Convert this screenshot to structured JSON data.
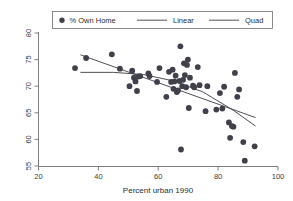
{
  "chart_data": {
    "type": "scatter",
    "title": "",
    "subtitle": "",
    "xlabel": "Percent urban 1990",
    "ylabel": "",
    "xlim": [
      20,
      100
    ],
    "ylim": [
      53,
      81
    ],
    "xticks": [
      20,
      40,
      60,
      80,
      100
    ],
    "yticks": [
      55,
      60,
      65,
      70,
      75,
      80
    ],
    "grid": false,
    "legend_position": "top-center-outside",
    "legend": [
      {
        "label": "% Own Home",
        "type": "marker",
        "marker": "filled-circle",
        "color": "#40404a"
      },
      {
        "label": "Linear",
        "type": "line",
        "color": "#3b3b43"
      },
      {
        "label": "Quad",
        "type": "line",
        "color": "#3b3b43"
      }
    ],
    "series": [
      {
        "name": "% Own Home",
        "type": "scatter",
        "marker": "filled-circle",
        "color": "#40404a",
        "points": [
          [
            32.2,
            73.4
          ],
          [
            35.9,
            75.3
          ],
          [
            44.5,
            76.0
          ],
          [
            47.2,
            73.3
          ],
          [
            50.4,
            70.0
          ],
          [
            51.3,
            72.9
          ],
          [
            51.9,
            71.6
          ],
          [
            52.4,
            70.9
          ],
          [
            52.9,
            69.1
          ],
          [
            53.4,
            71.8
          ],
          [
            54.0,
            71.9
          ],
          [
            56.7,
            72.4
          ],
          [
            57.1,
            71.9
          ],
          [
            59.6,
            70.8
          ],
          [
            60.4,
            73.4
          ],
          [
            62.7,
            68.0
          ],
          [
            63.6,
            72.7
          ],
          [
            64.3,
            70.8
          ],
          [
            64.8,
            73.1
          ],
          [
            65.1,
            69.5
          ],
          [
            65.4,
            70.9
          ],
          [
            65.8,
            72.0
          ],
          [
            66.2,
            68.9
          ],
          [
            66.6,
            69.2
          ],
          [
            67.1,
            71.0
          ],
          [
            67.4,
            77.5
          ],
          [
            67.6,
            58.1
          ],
          [
            68.0,
            70.0
          ],
          [
            68.3,
            71.2
          ],
          [
            68.6,
            74.3
          ],
          [
            68.9,
            72.1
          ],
          [
            69.3,
            69.8
          ],
          [
            69.6,
            74.0
          ],
          [
            69.9,
            75.0
          ],
          [
            70.2,
            65.9
          ],
          [
            70.6,
            71.6
          ],
          [
            71.6,
            70.1
          ],
          [
            72.0,
            69.8
          ],
          [
            73.2,
            73.6
          ],
          [
            73.8,
            70.2
          ],
          [
            75.8,
            65.3
          ],
          [
            76.4,
            70.0
          ],
          [
            79.4,
            65.6
          ],
          [
            80.6,
            68.7
          ],
          [
            81.4,
            65.8
          ],
          [
            82.0,
            69.9
          ],
          [
            83.6,
            63.2
          ],
          [
            84.0,
            60.3
          ],
          [
            84.6,
            62.5
          ],
          [
            85.1,
            62.4
          ],
          [
            85.6,
            72.5
          ],
          [
            86.4,
            68.0
          ],
          [
            87.0,
            69.4
          ],
          [
            88.4,
            59.5
          ],
          [
            88.9,
            56.0
          ],
          [
            92.2,
            58.7
          ]
        ]
      },
      {
        "name": "Linear",
        "type": "line",
        "color": "#3b3b43",
        "x": [
          34.0,
          92.5
        ],
        "y": [
          75.9,
          64.1
        ]
      },
      {
        "name": "Quad",
        "type": "line",
        "color": "#3b3b43",
        "x": [
          34.0,
          45.0,
          55.0,
          65.0,
          75.0,
          85.0,
          92.5
        ],
        "y": [
          72.6,
          72.6,
          72.2,
          71.0,
          68.9,
          65.5,
          62.5
        ]
      }
    ]
  }
}
